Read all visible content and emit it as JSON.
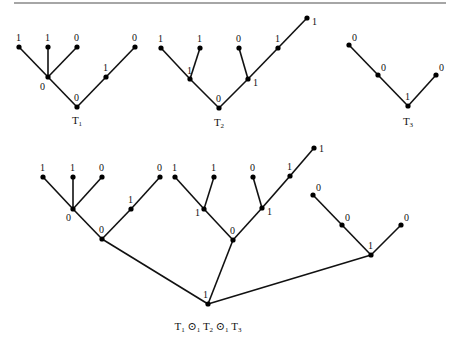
{
  "figure": {
    "top_rule": {
      "x1": 14,
      "y1": 3,
      "x2": 446,
      "y2": 3,
      "color": "#888888"
    },
    "trees": [
      {
        "id": "T1",
        "caption": {
          "base": "T",
          "sub": "1",
          "x": 77,
          "y": 124
        },
        "nodes": [
          {
            "id": "a",
            "x": 77,
            "y": 107,
            "label": "0",
            "lx": 74,
            "ly": 101
          },
          {
            "id": "b",
            "x": 48,
            "y": 77,
            "label": "0",
            "lx": 40,
            "ly": 90
          },
          {
            "id": "c",
            "x": 106,
            "y": 77,
            "label": "1",
            "lx": 103,
            "ly": 71
          },
          {
            "id": "d",
            "x": 19,
            "y": 47,
            "label": "1",
            "lx": 16,
            "ly": 41
          },
          {
            "id": "e",
            "x": 48,
            "y": 47,
            "label": "1",
            "lx": 45,
            "ly": 41
          },
          {
            "id": "f",
            "x": 77,
            "y": 47,
            "label": "0",
            "lx": 74,
            "ly": 41
          },
          {
            "id": "g",
            "x": 135,
            "y": 47,
            "label": "0",
            "lx": 132,
            "ly": 41
          }
        ],
        "edges": [
          [
            "a",
            "b"
          ],
          [
            "a",
            "c"
          ],
          [
            "b",
            "d"
          ],
          [
            "b",
            "e"
          ],
          [
            "b",
            "f"
          ],
          [
            "c",
            "g"
          ]
        ]
      },
      {
        "id": "T2",
        "caption": {
          "base": "T",
          "sub": "2",
          "x": 219,
          "y": 126
        },
        "nodes": [
          {
            "id": "a",
            "x": 219,
            "y": 108,
            "label": "0",
            "lx": 216,
            "ly": 102
          },
          {
            "id": "b",
            "x": 190,
            "y": 79,
            "label": "1",
            "lx": 187,
            "ly": 74
          },
          {
            "id": "c",
            "x": 248,
            "y": 79,
            "label": "1",
            "lx": 253,
            "ly": 86
          },
          {
            "id": "d",
            "x": 161,
            "y": 48,
            "label": "1",
            "lx": 158,
            "ly": 42
          },
          {
            "id": "e",
            "x": 200,
            "y": 48,
            "label": "1",
            "lx": 197,
            "ly": 42
          },
          {
            "id": "f",
            "x": 239,
            "y": 48,
            "label": "0",
            "lx": 236,
            "ly": 42
          },
          {
            "id": "g",
            "x": 278,
            "y": 48,
            "label": "1",
            "lx": 275,
            "ly": 42
          },
          {
            "id": "h",
            "x": 307,
            "y": 18,
            "label": "1",
            "lx": 312,
            "ly": 25
          }
        ],
        "edges": [
          [
            "a",
            "b"
          ],
          [
            "a",
            "c"
          ],
          [
            "b",
            "d"
          ],
          [
            "b",
            "e"
          ],
          [
            "c",
            "f"
          ],
          [
            "c",
            "g"
          ],
          [
            "g",
            "h"
          ]
        ]
      },
      {
        "id": "T3",
        "caption": {
          "base": "T",
          "sub": "3",
          "x": 408,
          "y": 125
        },
        "nodes": [
          {
            "id": "a",
            "x": 408,
            "y": 106,
            "label": "1",
            "lx": 405,
            "ly": 100
          },
          {
            "id": "b",
            "x": 378,
            "y": 75,
            "label": "0",
            "lx": 381,
            "ly": 71
          },
          {
            "id": "c",
            "x": 436,
            "y": 75,
            "label": "0",
            "lx": 439,
            "ly": 71
          },
          {
            "id": "d",
            "x": 349,
            "y": 45,
            "label": "0",
            "lx": 352,
            "ly": 41
          }
        ],
        "edges": [
          [
            "a",
            "b"
          ],
          [
            "a",
            "c"
          ],
          [
            "b",
            "d"
          ]
        ]
      },
      {
        "id": "T1_o1_T2_o1_T3",
        "caption": {
          "parts": [
            {
              "base": "T",
              "sub": "1"
            },
            {
              "op": "⊙",
              "sub": "1"
            },
            {
              "base": "T",
              "sub": "2"
            },
            {
              "op": "⊙",
              "sub": "1"
            },
            {
              "base": "T",
              "sub": "3"
            }
          ],
          "x": 208,
          "y": 330,
          "text": "T1 ⊙1 T2 ⊙1 T3"
        },
        "nodes": [
          {
            "id": "r",
            "x": 208,
            "y": 304,
            "label": "1",
            "lx": 203,
            "ly": 298
          },
          {
            "id": "a1",
            "x": 102,
            "y": 239,
            "label": "0",
            "lx": 99,
            "ly": 233
          },
          {
            "id": "b1",
            "x": 73,
            "y": 209,
            "label": "0",
            "lx": 66,
            "ly": 221
          },
          {
            "id": "c1",
            "x": 131,
            "y": 209,
            "label": "1",
            "lx": 128,
            "ly": 203
          },
          {
            "id": "d1",
            "x": 43,
            "y": 177,
            "label": "1",
            "lx": 40,
            "ly": 171
          },
          {
            "id": "e1",
            "x": 73,
            "y": 177,
            "label": "1",
            "lx": 70,
            "ly": 171
          },
          {
            "id": "f1",
            "x": 102,
            "y": 177,
            "label": "0",
            "lx": 99,
            "ly": 171
          },
          {
            "id": "g1",
            "x": 160,
            "y": 177,
            "label": "0",
            "lx": 157,
            "ly": 171
          },
          {
            "id": "a2",
            "x": 233,
            "y": 240,
            "label": "0",
            "lx": 230,
            "ly": 234
          },
          {
            "id": "b2",
            "x": 204,
            "y": 209,
            "label": "1",
            "lx": 195,
            "ly": 216
          },
          {
            "id": "c2",
            "x": 262,
            "y": 208,
            "label": "1",
            "lx": 267,
            "ly": 215
          },
          {
            "id": "d2",
            "x": 175,
            "y": 177,
            "label": "1",
            "lx": 172,
            "ly": 171
          },
          {
            "id": "e2",
            "x": 214,
            "y": 177,
            "label": "1",
            "lx": 211,
            "ly": 171
          },
          {
            "id": "f2",
            "x": 253,
            "y": 177,
            "label": "0",
            "lx": 250,
            "ly": 171
          },
          {
            "id": "g2",
            "x": 290,
            "y": 176,
            "label": "1",
            "lx": 287,
            "ly": 170
          },
          {
            "id": "h2",
            "x": 314,
            "y": 148,
            "label": "1",
            "lx": 319,
            "ly": 152
          },
          {
            "id": "a3",
            "x": 371,
            "y": 255,
            "label": "1",
            "lx": 368,
            "ly": 249
          },
          {
            "id": "b3",
            "x": 342,
            "y": 225,
            "label": "0",
            "lx": 345,
            "ly": 221
          },
          {
            "id": "c3",
            "x": 401,
            "y": 225,
            "label": "0",
            "lx": 404,
            "ly": 221
          },
          {
            "id": "d3",
            "x": 313,
            "y": 195,
            "label": "0",
            "lx": 316,
            "ly": 191
          }
        ],
        "edges": [
          [
            "r",
            "a1"
          ],
          [
            "r",
            "a2"
          ],
          [
            "r",
            "a3"
          ],
          [
            "a1",
            "b1"
          ],
          [
            "a1",
            "c1"
          ],
          [
            "b1",
            "d1"
          ],
          [
            "b1",
            "e1"
          ],
          [
            "b1",
            "f1"
          ],
          [
            "c1",
            "g1"
          ],
          [
            "a2",
            "b2"
          ],
          [
            "a2",
            "c2"
          ],
          [
            "b2",
            "d2"
          ],
          [
            "b2",
            "e2"
          ],
          [
            "c2",
            "f2"
          ],
          [
            "c2",
            "g2"
          ],
          [
            "g2",
            "h2"
          ],
          [
            "a3",
            "b3"
          ],
          [
            "a3",
            "c3"
          ],
          [
            "b3",
            "d3"
          ]
        ]
      }
    ]
  }
}
